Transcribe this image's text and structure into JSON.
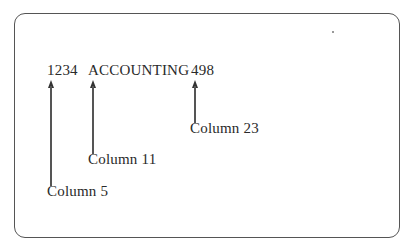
{
  "record": {
    "fields": [
      {
        "value": "1234",
        "column_label": "Column 5"
      },
      {
        "value": "ACCOUNTING",
        "column_label": "Column 11"
      },
      {
        "value": "498",
        "column_label": "Column 23"
      }
    ]
  }
}
